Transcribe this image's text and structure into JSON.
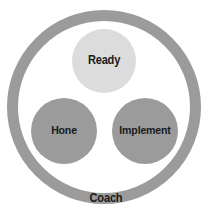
{
  "diagram": {
    "title": "Coach",
    "type": "venn-circles-in-ring",
    "outer_ring": {
      "label": "Coach",
      "color": "#9b9b9b",
      "center_x": 104,
      "center_y": 107,
      "outer_radius": 97,
      "thickness": 11
    },
    "nodes": [
      {
        "id": "ready",
        "label": "Ready",
        "color": "#dcdcdc",
        "center_x": 104,
        "center_y": 61,
        "radius": 32
      },
      {
        "id": "hone",
        "label": "Hone",
        "color": "#9b9b9b",
        "center_x": 64,
        "center_y": 131,
        "radius": 33
      },
      {
        "id": "implement",
        "label": "Implement",
        "color": "#9b9b9b",
        "center_x": 145,
        "center_y": 131,
        "radius": 33
      }
    ],
    "colors": {
      "background": "#ffffff",
      "ring_gray": "#9b9b9b",
      "circle_gray": "#9b9b9b",
      "light_gray": "#dcdcdc",
      "text": "#1a1a1a"
    }
  }
}
